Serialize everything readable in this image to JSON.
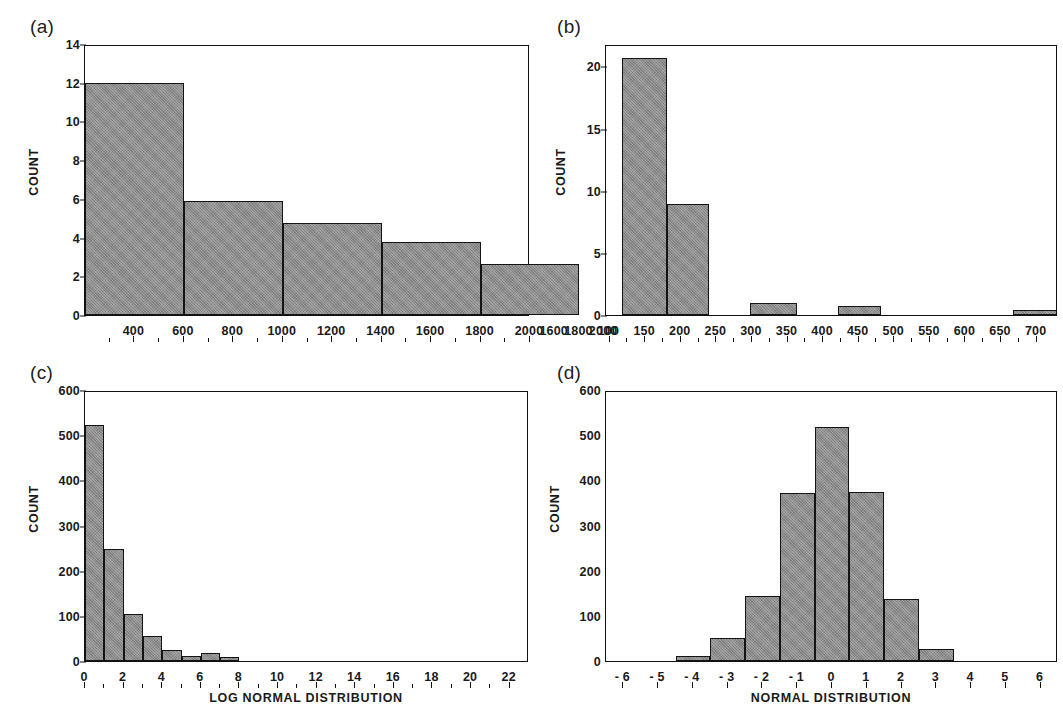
{
  "figure": {
    "background": "#ffffff",
    "bar_fill": "#8b8b8b",
    "bar_stroke": "#141414",
    "axis_color": "#111111"
  },
  "panels": [
    {
      "id": "a",
      "letter": "(a)",
      "ylabel": "COUNT",
      "xlabel": ""
    },
    {
      "id": "b",
      "letter": "(b)",
      "ylabel": "COUNT",
      "xlabel": ""
    },
    {
      "id": "c",
      "letter": "(c)",
      "ylabel": "COUNT",
      "xlabel": "LOG NORMAL DISTRIBUTION"
    },
    {
      "id": "d",
      "letter": "(d)",
      "ylabel": "COUNT",
      "xlabel": "NORMAL DISTRIBUTION"
    }
  ],
  "chart_data": [
    {
      "panel": "a",
      "type": "bar",
      "title": "(a)",
      "xlabel": "",
      "ylabel": "COUNT",
      "ylim": [
        0,
        14
      ],
      "yticks": [
        0,
        2,
        4,
        6,
        8,
        10,
        12,
        14
      ],
      "ytick_labels": [
        "0",
        "2",
        "4",
        "6",
        "8",
        "10",
        "12",
        "14"
      ],
      "xlim": [
        200,
        2000
      ],
      "xticks": [
        400,
        600,
        800,
        1000,
        1200,
        1400,
        1600,
        1800,
        2000,
        2100,
        2200,
        2300
      ],
      "xtick_labels": [
        "400",
        "600",
        "800",
        "1000",
        "1200",
        "1400",
        "1600",
        "1800",
        "2000",
        "1600",
        "1800",
        "2000"
      ],
      "grid": false,
      "legend": null,
      "bins": [
        {
          "start": 200,
          "end": 600,
          "value": 12.0
        },
        {
          "start": 600,
          "end": 1000,
          "value": 5.9
        },
        {
          "start": 1000,
          "end": 1400,
          "value": 4.75
        },
        {
          "start": 1400,
          "end": 1800,
          "value": 3.75
        },
        {
          "start": 1800,
          "end": 2200,
          "value": 2.65
        }
      ],
      "values": [
        12.0,
        5.9,
        4.75,
        3.75,
        2.65
      ]
    },
    {
      "panel": "b",
      "type": "bar",
      "title": "(b)",
      "xlabel": "",
      "ylabel": "COUNT",
      "ylim": [
        0,
        21.8
      ],
      "yticks": [
        0,
        5,
        10,
        15,
        20
      ],
      "ytick_labels": [
        "0",
        "5",
        "10",
        "15",
        "20"
      ],
      "xlim": [
        95,
        730
      ],
      "xticks": [
        100,
        150,
        200,
        250,
        300,
        350,
        400,
        450,
        500,
        550,
        600,
        650,
        700
      ],
      "xtick_labels": [
        "100",
        "150",
        "200",
        "250",
        "300",
        "350",
        "400",
        "450",
        "500",
        "550",
        "600",
        "650",
        "700"
      ],
      "grid": false,
      "legend": null,
      "bins": [
        {
          "start": 117,
          "end": 180,
          "value": 20.7
        },
        {
          "start": 180,
          "end": 240,
          "value": 8.9
        },
        {
          "start": 297,
          "end": 363,
          "value": 1.0
        },
        {
          "start": 421,
          "end": 481,
          "value": 0.72
        },
        {
          "start": 667,
          "end": 729,
          "value": 0.42
        }
      ],
      "values": [
        20.7,
        8.9,
        1.0,
        0.72,
        0.42
      ]
    },
    {
      "panel": "c",
      "type": "bar",
      "title": "(c)",
      "xlabel": "LOG NORMAL DISTRIBUTION",
      "ylabel": "COUNT",
      "ylim": [
        0,
        600
      ],
      "yticks": [
        0,
        100,
        200,
        300,
        400,
        500,
        600
      ],
      "ytick_labels": [
        "0",
        "100",
        "200",
        "300",
        "400",
        "500",
        "600"
      ],
      "xlim": [
        0,
        23
      ],
      "xticks": [
        0,
        2,
        4,
        6,
        8,
        10,
        12,
        14,
        16,
        18,
        20,
        22
      ],
      "xtick_labels": [
        "0",
        "2",
        "4",
        "6",
        "8",
        "10",
        "12",
        "14",
        "16",
        "18",
        "20",
        "22"
      ],
      "grid": false,
      "legend": null,
      "bins": [
        {
          "start": 0,
          "end": 1,
          "value": 522
        },
        {
          "start": 1,
          "end": 2,
          "value": 247
        },
        {
          "start": 2,
          "end": 3,
          "value": 103
        },
        {
          "start": 3,
          "end": 4,
          "value": 55
        },
        {
          "start": 4,
          "end": 5,
          "value": 25
        },
        {
          "start": 5,
          "end": 6,
          "value": 12
        },
        {
          "start": 6,
          "end": 7,
          "value": 18
        },
        {
          "start": 7,
          "end": 8,
          "value": 9
        }
      ],
      "values": [
        522,
        247,
        103,
        55,
        25,
        12,
        18,
        9
      ]
    },
    {
      "panel": "d",
      "type": "bar",
      "title": "(d)",
      "xlabel": "NORMAL DISTRIBUTION",
      "ylabel": "COUNT",
      "ylim": [
        0,
        600
      ],
      "yticks": [
        0,
        100,
        200,
        300,
        400,
        500,
        600
      ],
      "ytick_labels": [
        "0",
        "100",
        "200",
        "300",
        "400",
        "500",
        "600"
      ],
      "xlim": [
        -6.5,
        6.5
      ],
      "xticks": [
        -6,
        -5,
        -4,
        -3,
        -2,
        -1,
        0,
        1,
        2,
        3,
        4,
        5,
        6
      ],
      "xtick_labels": [
        "- 6",
        "- 5",
        "- 4",
        "- 3",
        "- 2",
        "- 1",
        "0",
        "1",
        "2",
        "3",
        "4",
        "5",
        "6"
      ],
      "grid": false,
      "legend": null,
      "bins": [
        {
          "start": -4.5,
          "end": -3.5,
          "value": 12
        },
        {
          "start": -3.5,
          "end": -2.5,
          "value": 50
        },
        {
          "start": -2.5,
          "end": -1.5,
          "value": 143
        },
        {
          "start": -1.5,
          "end": -0.5,
          "value": 373
        },
        {
          "start": -0.5,
          "end": 0.5,
          "value": 518
        },
        {
          "start": 0.5,
          "end": 1.5,
          "value": 375
        },
        {
          "start": 1.5,
          "end": 2.5,
          "value": 138
        },
        {
          "start": 2.5,
          "end": 3.5,
          "value": 27
        }
      ],
      "values": [
        12,
        50,
        143,
        373,
        518,
        375,
        138,
        27
      ]
    }
  ]
}
